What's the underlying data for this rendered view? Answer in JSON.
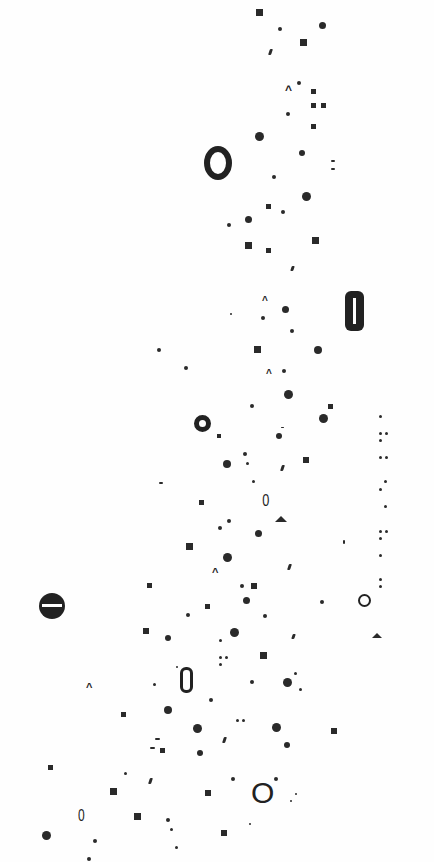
{
  "canvas": {
    "width": 434,
    "height": 862,
    "background": "#fefefe",
    "ink": "#2a2a2a"
  },
  "marks": [
    {
      "t": "sq",
      "x": 256,
      "y": 9,
      "s": 7
    },
    {
      "t": "dot",
      "x": 278,
      "y": 27,
      "s": 4
    },
    {
      "t": "dot",
      "x": 319,
      "y": 22,
      "s": 7
    },
    {
      "t": "sq",
      "x": 300,
      "y": 39,
      "s": 7
    },
    {
      "t": "slash",
      "x": 269,
      "y": 49,
      "w": 3,
      "h": 6
    },
    {
      "t": "caret",
      "x": 285,
      "y": 84,
      "s": 9
    },
    {
      "t": "dot",
      "x": 297,
      "y": 81,
      "s": 4
    },
    {
      "t": "sq",
      "x": 311,
      "y": 89,
      "s": 5
    },
    {
      "t": "sq",
      "x": 311,
      "y": 103,
      "s": 5
    },
    {
      "t": "sq",
      "x": 321,
      "y": 103,
      "s": 5
    },
    {
      "t": "dot",
      "x": 286,
      "y": 112,
      "s": 4
    },
    {
      "t": "sq",
      "x": 311,
      "y": 124,
      "s": 5
    },
    {
      "t": "dot",
      "x": 255,
      "y": 132,
      "s": 9
    },
    {
      "t": "bigzero",
      "x": 204,
      "y": 146,
      "w": 28,
      "h": 34,
      "text": "0"
    },
    {
      "t": "dot",
      "x": 299,
      "y": 150,
      "s": 6
    },
    {
      "t": "dash",
      "x": 331,
      "y": 160,
      "w": 4,
      "h": 2
    },
    {
      "t": "dash",
      "x": 331,
      "y": 168,
      "w": 4,
      "h": 2
    },
    {
      "t": "dot",
      "x": 272,
      "y": 175,
      "s": 4
    },
    {
      "t": "dot",
      "x": 302,
      "y": 192,
      "s": 9
    },
    {
      "t": "sq",
      "x": 266,
      "y": 204,
      "s": 5
    },
    {
      "t": "dot",
      "x": 281,
      "y": 210,
      "s": 4
    },
    {
      "t": "dot",
      "x": 245,
      "y": 216,
      "s": 7
    },
    {
      "t": "dot",
      "x": 227,
      "y": 223,
      "s": 4
    },
    {
      "t": "sq",
      "x": 312,
      "y": 237,
      "s": 7
    },
    {
      "t": "sq",
      "x": 245,
      "y": 242,
      "s": 7
    },
    {
      "t": "sq",
      "x": 266,
      "y": 248,
      "s": 5
    },
    {
      "t": "slash",
      "x": 291,
      "y": 266,
      "w": 3,
      "h": 5
    },
    {
      "t": "caret",
      "x": 262,
      "y": 296,
      "s": 7
    },
    {
      "t": "pill",
      "x": 345,
      "y": 291,
      "w": 19,
      "h": 40
    },
    {
      "t": "dot",
      "x": 282,
      "y": 306,
      "s": 7
    },
    {
      "t": "dot",
      "x": 230,
      "y": 313,
      "s": 2
    },
    {
      "t": "dot",
      "x": 261,
      "y": 316,
      "s": 4
    },
    {
      "t": "dot",
      "x": 290,
      "y": 329,
      "s": 4
    },
    {
      "t": "dot",
      "x": 157,
      "y": 348,
      "s": 4
    },
    {
      "t": "sq",
      "x": 254,
      "y": 346,
      "s": 7
    },
    {
      "t": "dot",
      "x": 314,
      "y": 346,
      "s": 8
    },
    {
      "t": "dot",
      "x": 184,
      "y": 366,
      "s": 4
    },
    {
      "t": "caret",
      "x": 266,
      "y": 369,
      "s": 7
    },
    {
      "t": "dot",
      "x": 282,
      "y": 369,
      "s": 4
    },
    {
      "t": "dot",
      "x": 284,
      "y": 390,
      "s": 9
    },
    {
      "t": "dot",
      "x": 250,
      "y": 404,
      "s": 4
    },
    {
      "t": "sq",
      "x": 328,
      "y": 404,
      "s": 5
    },
    {
      "t": "ring",
      "x": 194,
      "y": 415,
      "s": 17,
      "bw": 5
    },
    {
      "t": "dot",
      "x": 319,
      "y": 414,
      "s": 9
    },
    {
      "t": "dot",
      "x": 379,
      "y": 415,
      "s": 3
    },
    {
      "t": "sq",
      "x": 217,
      "y": 434,
      "s": 4
    },
    {
      "t": "dash",
      "x": 281,
      "y": 427,
      "w": 3,
      "h": 1
    },
    {
      "t": "dot",
      "x": 276,
      "y": 433,
      "s": 6
    },
    {
      "t": "dot",
      "x": 379,
      "y": 432,
      "s": 3
    },
    {
      "t": "dot",
      "x": 385,
      "y": 432,
      "s": 3
    },
    {
      "t": "dot",
      "x": 379,
      "y": 439,
      "s": 3
    },
    {
      "t": "dot",
      "x": 243,
      "y": 452,
      "s": 4
    },
    {
      "t": "sq",
      "x": 303,
      "y": 457,
      "s": 6
    },
    {
      "t": "dot",
      "x": 223,
      "y": 460,
      "s": 8
    },
    {
      "t": "dot",
      "x": 246,
      "y": 462,
      "s": 3
    },
    {
      "t": "slash",
      "x": 281,
      "y": 465,
      "w": 3,
      "h": 6
    },
    {
      "t": "dot",
      "x": 379,
      "y": 456,
      "s": 3
    },
    {
      "t": "dot",
      "x": 385,
      "y": 456,
      "s": 3
    },
    {
      "t": "dash",
      "x": 159,
      "y": 482,
      "w": 4,
      "h": 2
    },
    {
      "t": "dot",
      "x": 252,
      "y": 480,
      "s": 3
    },
    {
      "t": "dot",
      "x": 384,
      "y": 480,
      "s": 3
    },
    {
      "t": "dot",
      "x": 379,
      "y": 488,
      "s": 3
    },
    {
      "t": "sq",
      "x": 199,
      "y": 500,
      "s": 5
    },
    {
      "t": "zero",
      "x": 261,
      "y": 492,
      "fs": 17,
      "text": "0"
    },
    {
      "t": "dot",
      "x": 384,
      "y": 505,
      "s": 3
    },
    {
      "t": "tri",
      "x": 275,
      "y": 516,
      "w": 13,
      "h": 6
    },
    {
      "t": "dot",
      "x": 227,
      "y": 519,
      "s": 4
    },
    {
      "t": "dot",
      "x": 218,
      "y": 526,
      "s": 4
    },
    {
      "t": "dot",
      "x": 255,
      "y": 530,
      "s": 7
    },
    {
      "t": "dot",
      "x": 379,
      "y": 530,
      "s": 3
    },
    {
      "t": "dot",
      "x": 385,
      "y": 530,
      "s": 3
    },
    {
      "t": "dot",
      "x": 379,
      "y": 537,
      "s": 3
    },
    {
      "t": "sq",
      "x": 186,
      "y": 543,
      "s": 7
    },
    {
      "t": "dash",
      "x": 343,
      "y": 540,
      "w": 2,
      "h": 4
    },
    {
      "t": "dot",
      "x": 223,
      "y": 553,
      "s": 9
    },
    {
      "t": "dot",
      "x": 379,
      "y": 554,
      "s": 3
    },
    {
      "t": "slash",
      "x": 288,
      "y": 564,
      "w": 3,
      "h": 6
    },
    {
      "t": "caret",
      "x": 212,
      "y": 567,
      "s": 8
    },
    {
      "t": "sq",
      "x": 147,
      "y": 583,
      "s": 5
    },
    {
      "t": "dot",
      "x": 240,
      "y": 584,
      "s": 4
    },
    {
      "t": "sq",
      "x": 251,
      "y": 583,
      "s": 6
    },
    {
      "t": "dot",
      "x": 379,
      "y": 578,
      "s": 3
    },
    {
      "t": "dot",
      "x": 379,
      "y": 585,
      "s": 3
    },
    {
      "t": "hdisc",
      "x": 39,
      "y": 593,
      "s": 26
    },
    {
      "t": "sq",
      "x": 205,
      "y": 604,
      "s": 5
    },
    {
      "t": "dot",
      "x": 243,
      "y": 597,
      "s": 7
    },
    {
      "t": "dot",
      "x": 320,
      "y": 600,
      "s": 4
    },
    {
      "t": "ring",
      "x": 358,
      "y": 594,
      "s": 13,
      "bw": 2.5
    },
    {
      "t": "dot",
      "x": 186,
      "y": 613,
      "s": 4
    },
    {
      "t": "dot",
      "x": 263,
      "y": 614,
      "s": 4
    },
    {
      "t": "sq",
      "x": 143,
      "y": 628,
      "s": 6
    },
    {
      "t": "dot",
      "x": 165,
      "y": 635,
      "s": 6
    },
    {
      "t": "dot",
      "x": 230,
      "y": 628,
      "s": 9
    },
    {
      "t": "dot",
      "x": 219,
      "y": 639,
      "s": 3
    },
    {
      "t": "slash",
      "x": 292,
      "y": 634,
      "w": 3,
      "h": 5
    },
    {
      "t": "tri",
      "x": 372,
      "y": 633,
      "w": 11,
      "h": 5
    },
    {
      "t": "dot",
      "x": 219,
      "y": 656,
      "s": 3
    },
    {
      "t": "dot",
      "x": 225,
      "y": 656,
      "s": 3
    },
    {
      "t": "dot",
      "x": 219,
      "y": 663,
      "s": 3
    },
    {
      "t": "sq",
      "x": 260,
      "y": 652,
      "s": 7
    },
    {
      "t": "dot",
      "x": 176,
      "y": 666,
      "s": 2
    },
    {
      "t": "slot",
      "x": 180,
      "y": 667,
      "w": 13,
      "h": 26
    },
    {
      "t": "dot",
      "x": 294,
      "y": 672,
      "s": 3
    },
    {
      "t": "caret",
      "x": 86,
      "y": 682,
      "s": 8
    },
    {
      "t": "dot",
      "x": 153,
      "y": 683,
      "s": 3
    },
    {
      "t": "dot",
      "x": 250,
      "y": 680,
      "s": 4
    },
    {
      "t": "dot",
      "x": 283,
      "y": 678,
      "s": 9
    },
    {
      "t": "dot",
      "x": 299,
      "y": 688,
      "s": 3
    },
    {
      "t": "dot",
      "x": 209,
      "y": 698,
      "s": 4
    },
    {
      "t": "sq",
      "x": 121,
      "y": 712,
      "s": 5
    },
    {
      "t": "dot",
      "x": 164,
      "y": 706,
      "s": 8
    },
    {
      "t": "dot",
      "x": 236,
      "y": 719,
      "s": 3
    },
    {
      "t": "dot",
      "x": 242,
      "y": 719,
      "s": 3
    },
    {
      "t": "dot",
      "x": 193,
      "y": 724,
      "s": 9
    },
    {
      "t": "dot",
      "x": 272,
      "y": 723,
      "s": 9
    },
    {
      "t": "sq",
      "x": 331,
      "y": 728,
      "s": 6
    },
    {
      "t": "dash",
      "x": 155,
      "y": 738,
      "w": 5,
      "h": 2
    },
    {
      "t": "slash",
      "x": 223,
      "y": 737,
      "w": 3,
      "h": 6
    },
    {
      "t": "dot",
      "x": 284,
      "y": 742,
      "s": 6
    },
    {
      "t": "dash",
      "x": 150,
      "y": 747,
      "w": 5,
      "h": 2
    },
    {
      "t": "sq",
      "x": 160,
      "y": 748,
      "s": 5
    },
    {
      "t": "dot",
      "x": 197,
      "y": 750,
      "s": 6
    },
    {
      "t": "sq",
      "x": 48,
      "y": 765,
      "s": 5
    },
    {
      "t": "dot",
      "x": 124,
      "y": 772,
      "s": 3
    },
    {
      "t": "dot",
      "x": 231,
      "y": 777,
      "s": 4
    },
    {
      "t": "dot",
      "x": 274,
      "y": 777,
      "s": 4
    },
    {
      "t": "slash",
      "x": 149,
      "y": 778,
      "w": 3,
      "h": 6
    },
    {
      "t": "bigzero2",
      "x": 251,
      "y": 778,
      "fs": 30,
      "text": "O"
    },
    {
      "t": "sq",
      "x": 110,
      "y": 788,
      "s": 7
    },
    {
      "t": "sq",
      "x": 205,
      "y": 790,
      "s": 6
    },
    {
      "t": "dot",
      "x": 295,
      "y": 793,
      "s": 2
    },
    {
      "t": "dot",
      "x": 290,
      "y": 800,
      "s": 2
    },
    {
      "t": "zero",
      "x": 77,
      "y": 808,
      "fs": 16,
      "text": "0"
    },
    {
      "t": "sq",
      "x": 134,
      "y": 813,
      "s": 7
    },
    {
      "t": "dot",
      "x": 166,
      "y": 818,
      "s": 4
    },
    {
      "t": "dot",
      "x": 170,
      "y": 828,
      "s": 3
    },
    {
      "t": "sq",
      "x": 221,
      "y": 830,
      "s": 6
    },
    {
      "t": "dot",
      "x": 249,
      "y": 823,
      "s": 2
    },
    {
      "t": "dot",
      "x": 42,
      "y": 831,
      "s": 9
    },
    {
      "t": "dot",
      "x": 93,
      "y": 839,
      "s": 4
    },
    {
      "t": "dot",
      "x": 175,
      "y": 846,
      "s": 3
    },
    {
      "t": "dot",
      "x": 87,
      "y": 857,
      "s": 4
    }
  ]
}
